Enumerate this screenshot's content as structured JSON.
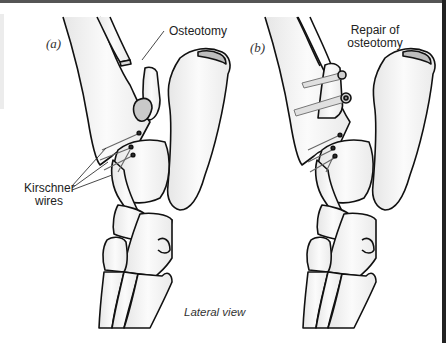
{
  "figure": {
    "panels": [
      {
        "id": "a",
        "label": "(a)",
        "callouts": [
          {
            "text": "Osteotomy"
          },
          {
            "text_lines": [
              "Kirschner",
              "wires"
            ]
          }
        ]
      },
      {
        "id": "b",
        "label": "(b)",
        "callouts": [
          {
            "text_lines": [
              "Repair of",
              "osteotomy"
            ]
          }
        ]
      }
    ],
    "caption": "Lateral view",
    "colors": {
      "line": "#111111",
      "bone_fill": "#f4f4f4",
      "shade": "#c8c8c8",
      "frame": "#222222"
    }
  }
}
